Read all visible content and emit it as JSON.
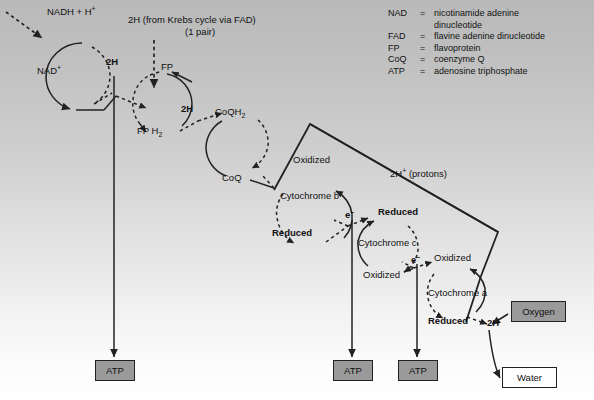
{
  "diagram": {
    "background_top_color": "#b9b9b9",
    "background_bottom_color": "#ffffff"
  },
  "legend": {
    "rows": [
      {
        "abbr": "NAD",
        "eq": "=",
        "term": "nicotinamide adenine"
      },
      {
        "abbr": "",
        "eq": "",
        "term": "dinucleotide"
      },
      {
        "abbr": "FAD",
        "eq": "=",
        "term": "flavine adenine dinucleotide"
      },
      {
        "abbr": "FP",
        "eq": "=",
        "term": "flavoprotein"
      },
      {
        "abbr": "CoQ",
        "eq": "=",
        "term": "coenzyme Q"
      },
      {
        "abbr": "ATP",
        "eq": "=",
        "term": "adenosine triphosphate"
      }
    ]
  },
  "labels": {
    "nadh": "NADH + H",
    "nadh_sup": "+",
    "nad": "NAD",
    "nad_sup": "+",
    "krebs_line1": "2H",
    "krebs_line1_rest": " (from Krebs cycle via FAD)",
    "krebs_line2": "(1 pair)",
    "twoh_1": "2H",
    "twoh_2": "2H",
    "fp": "FP",
    "fph2": "FP H",
    "fph2_sub": "2",
    "coqh2": "CoQH",
    "coqh2_sub": "2",
    "coq": "CoQ",
    "cyt_b": "Cytochrome b",
    "cyt_b_oxidized": "Oxidized",
    "cyt_b_reduced": "Reduced",
    "cyt_c": "Cytochrome c",
    "cyt_c_oxidized": "Oxidized",
    "cyt_c_reduced": "Reduced",
    "cyt_a": "Cytochrome a",
    "cyt_a_oxidized": "Oxidized",
    "cyt_a_reduced": "Reduced",
    "electron_1": "e",
    "electron_2": "e",
    "electron_sup": "–",
    "protons": "2H",
    "protons_sup": "+",
    "protons_rest": " (protons)",
    "twoh_final": "2H"
  },
  "boxes": {
    "atp_1": "ATP",
    "atp_2": "ATP",
    "atp_3": "ATP",
    "oxygen": "Oxygen",
    "water": "Water"
  },
  "colors": {
    "atp_box_fill": "#9a9a9a",
    "oxygen_box_fill": "#9a9a9a",
    "water_box_fill": "#ffffff",
    "stroke": "#222222",
    "text": "#111111"
  }
}
